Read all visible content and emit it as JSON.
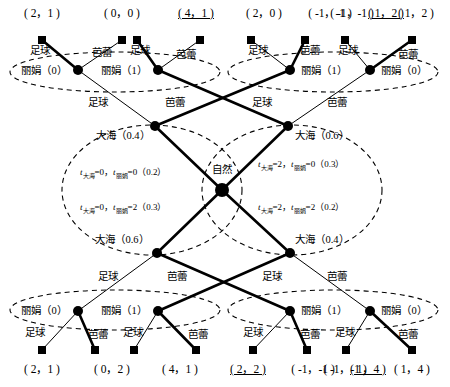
{
  "figure": {
    "type": "extensive-form-game-tree",
    "nature_node_label": "自然",
    "player_names": {
      "p1": "大海",
      "p2": "丽娟"
    },
    "actions": {
      "football": "足球",
      "ballet": "芭蕾"
    }
  },
  "top_payoffs": [
    {
      "text": "( 2，1 )",
      "underlined": false
    },
    {
      "text": "( 0，0 )",
      "underlined": false
    },
    {
      "text": "( 4，1 )",
      "underlined": true
    },
    {
      "text": "( 2，0 )",
      "underlined": false
    },
    {
      "text": "( -1，-1 )",
      "underlined": false
    },
    {
      "text": "( 1，2 )",
      "underlined": true
    },
    {
      "text": "( -1，-1 )",
      "underlined": false
    },
    {
      "text": "( 1，2 )",
      "underlined": false
    }
  ],
  "bottom_payoffs": [
    {
      "text": "( 2，1 )",
      "underlined": false
    },
    {
      "text": "( 0，2 )",
      "underlined": false
    },
    {
      "text": "( 4，1 )",
      "underlined": false
    },
    {
      "text": "( 2，2 )",
      "underlined": true
    },
    {
      "text": "( -1，-1 )",
      "underlined": false
    },
    {
      "text": "( 1，4 )",
      "underlined": true
    },
    {
      "text": "( -1，-1 )",
      "underlined": false
    },
    {
      "text": "( 1，4 )",
      "underlined": false
    }
  ],
  "top_action_labels": [
    "足球",
    "芭蕾",
    "足球",
    "芭蕾",
    "足球",
    "芭蕾",
    "足球",
    "芭蕾"
  ],
  "bottom_action_labels": [
    "足球",
    "芭蕾",
    "足球",
    "芭蕾",
    "足球",
    "芭蕾",
    "足球",
    "芭蕾"
  ],
  "upper_player2_nodes": [
    "丽娟（0）",
    "丽娟（1）",
    "丽娟（1）",
    "丽娟（0）"
  ],
  "lower_player2_nodes": [
    "丽娟（0）",
    "丽娟（1）",
    "丽娟（1）",
    "丽娟（0）"
  ],
  "upper_player1_nodes": [
    "大海（0.4）",
    "大海（0.6）"
  ],
  "lower_player1_nodes": [
    "大海（0.6）",
    "大海（0.4）"
  ],
  "mid_action_labels": [
    "足球",
    "芭蕾",
    "足球",
    "芭蕾"
  ],
  "lower_mid_action_labels": [
    "足球",
    "芭蕾",
    "足球",
    "芭蕾"
  ],
  "nature_branches": [
    {
      "p1_type": "0",
      "p2_type": "0",
      "prob": "（0.2）",
      "text": "t大海=0，t丽娟=0（0.2）"
    },
    {
      "p1_type": "2",
      "p2_type": "0",
      "prob": "（0.3）",
      "text": "t大海=2，t丽娟=0（0.3）"
    },
    {
      "p1_type": "0",
      "p2_type": "2",
      "prob": "（0.3）",
      "text": "t大海=0，t丽娟=2（0.3）"
    },
    {
      "p1_type": "2",
      "p2_type": "2",
      "prob": "（0.2）",
      "text": "t大海=2，t丽娟=2（0.2）"
    }
  ],
  "symbols": {
    "t": "t",
    "eq": "=",
    "comma": "，"
  },
  "colors": {
    "ink": "#000000",
    "background": "#ffffff"
  }
}
